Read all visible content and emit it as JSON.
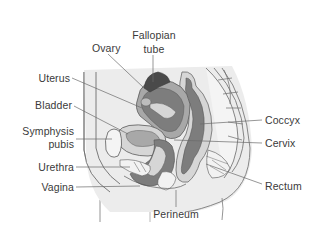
{
  "diagram": {
    "colors": {
      "background": "#ffffff",
      "body_fill": "#ececec",
      "body_stroke": "#7a7a7a",
      "organ_dark": "#7d7d7d",
      "organ_mid": "#a8a8a8",
      "organ_light": "#d6d6d6",
      "tube_dark": "#4a4a4a",
      "leader_line": "#6a6a6a",
      "label_text": "#3a3a3a"
    },
    "labels": {
      "fallopian_tube": {
        "line1": "Fallopian",
        "line2": "tube"
      },
      "ovary": "Ovary",
      "uterus": "Uterus",
      "bladder": "Bladder",
      "symphysis_pubis": {
        "line1": "Symphysis",
        "line2": "pubis"
      },
      "urethra": "Urethra",
      "vagina": "Vagina",
      "perineum": "Perineum",
      "coccyx": "Coccyx",
      "cervix": "Cervix",
      "rectum": "Rectum"
    }
  }
}
